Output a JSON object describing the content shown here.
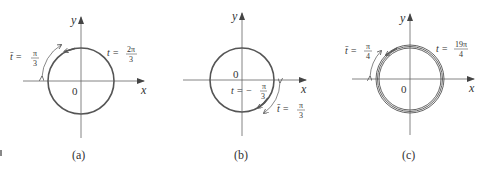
{
  "figure": {
    "panels": [
      {
        "caption": "(a)",
        "x_label": "x",
        "y_label": "y",
        "origin_label": "0",
        "t_label": "t =",
        "t_num": "2π",
        "t_den": "3",
        "tbar_label": "t̄ =",
        "tbar_num": "π",
        "tbar_den": "3"
      },
      {
        "caption": "(b)",
        "x_label": "x",
        "y_label": "y",
        "origin_label": "0",
        "t_label": "t = −",
        "t_num": "π",
        "t_den": "3",
        "tbar_label": "t̄ =",
        "tbar_num": "π",
        "tbar_den": "3"
      },
      {
        "caption": "(c)",
        "x_label": "x",
        "y_label": "y",
        "origin_label": "0",
        "t_label": "t =",
        "t_num": "19π",
        "t_den": "4",
        "tbar_label": "t̄ =",
        "tbar_num": "π",
        "tbar_den": "4"
      }
    ],
    "colors": {
      "curve": "#555555",
      "axis": "#666666",
      "text": "#333333"
    }
  }
}
